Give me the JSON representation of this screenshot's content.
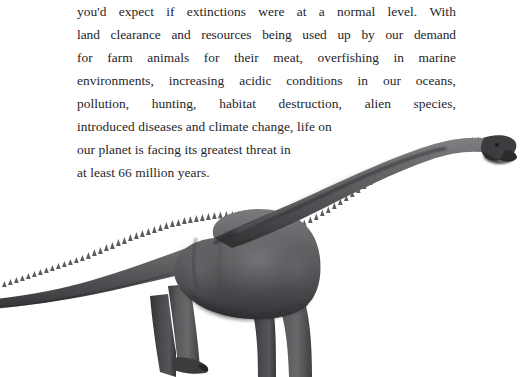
{
  "page": {
    "background_color": "#ffffff",
    "text_color": "#25252b",
    "width": 520,
    "height": 377
  },
  "body_text": {
    "full_text": "you'd expect if extinctions were at a normal level. With land clearance and resources being used up by our demand for farm animals for their meat, overfishing in marine environments, increasing acidic conditions in our oceans, pollution, hunting, habitat destruction, alien species, introduced diseases and climate change, life on our planet is facing its greatest threat in at least 66 million years.",
    "lines": [
      {
        "justified": true,
        "words": [
          "you'd",
          "expect",
          "if",
          "extinctions",
          "were",
          "at",
          "a",
          "normal",
          "level.",
          "With"
        ]
      },
      {
        "justified": true,
        "words": [
          "land",
          "clearance",
          "and",
          "resources",
          "being",
          "used",
          "up",
          "by",
          "our",
          "demand"
        ]
      },
      {
        "justified": true,
        "words": [
          "for",
          "farm",
          "animals",
          "for",
          "their",
          "meat,",
          "overfishing",
          "in",
          "marine"
        ]
      },
      {
        "justified": true,
        "words": [
          "environments,",
          "increasing",
          "acidic",
          "conditions",
          "in",
          "our",
          "oceans,"
        ]
      },
      {
        "justified": true,
        "words": [
          "pollution,",
          "hunting,",
          "habitat",
          "destruction,",
          "alien",
          "species,"
        ]
      },
      {
        "justified": false,
        "text": "introduced diseases and climate change, life on"
      },
      {
        "justified": false,
        "text": "our planet is facing its greatest threat in"
      },
      {
        "justified": false,
        "text": "at least 66 million years."
      }
    ]
  },
  "illustration": {
    "name": "sauropod-dinosaur",
    "description": "Grayscale side-view illustration of a long-necked sauropod dinosaur with a serrated dorsal ridge, tail running off the left edge and head raised at the upper right.",
    "body_color": "#5e5e60",
    "shadow_color": "#3a3a3c",
    "highlight_color": "#8b8b8d",
    "ridge_color": "#4a4a4c",
    "outline_color": "#2e2e30"
  }
}
